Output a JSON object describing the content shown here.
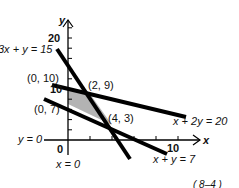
{
  "figure": {
    "caption": "( 8–4 )",
    "axes": {
      "x_label": "x",
      "y_label": "y",
      "origin_label": "0",
      "x_tick_label": "10",
      "y_tick_labels": [
        "10",
        "20"
      ]
    },
    "lines": [
      {
        "label": "3x + y = 15",
        "equation": "3x+y=15"
      },
      {
        "label": "x + 2y = 20",
        "equation": "x+2y=20"
      },
      {
        "label": "x + y = 7",
        "equation": "x+y=7"
      },
      {
        "label": "y = 0",
        "equation": "y=0"
      },
      {
        "label": "x = 0",
        "equation": "x=0"
      }
    ],
    "points": [
      {
        "label": "(0, 10)",
        "x": 0,
        "y": 10
      },
      {
        "label": "(2, 9)",
        "x": 2,
        "y": 9
      },
      {
        "label": "(0, 7)",
        "x": 0,
        "y": 7
      },
      {
        "label": "(4, 3)",
        "x": 4,
        "y": 3
      }
    ],
    "feasible_region_color": "#b3b3b3",
    "line_color": "#000000"
  }
}
